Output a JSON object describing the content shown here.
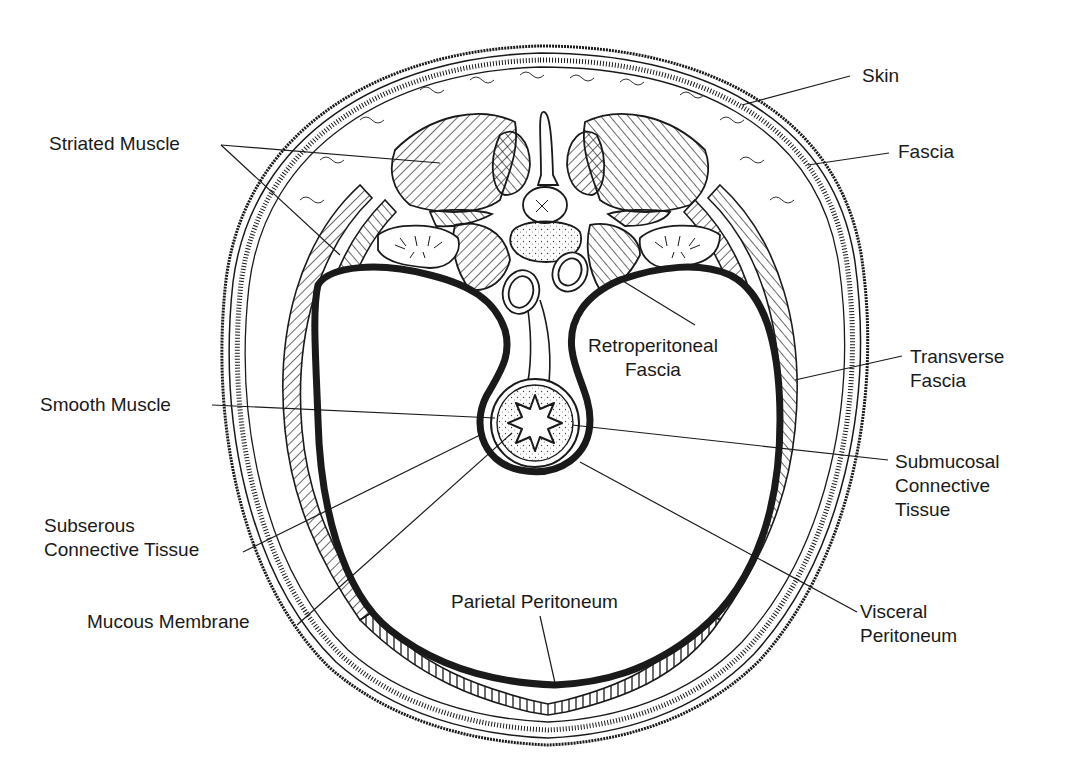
{
  "figure": {
    "colors": {
      "ink": "#1a1a1a",
      "background": "#ffffff",
      "fill_light": "#f7f7f7"
    }
  },
  "labels": [
    {
      "id": "skin",
      "lines": [
        "Skin"
      ],
      "x": 862,
      "y": 64,
      "align": "left",
      "leader": [
        [
          850,
          76
        ],
        [
          742,
          105
        ]
      ]
    },
    {
      "id": "fascia",
      "lines": [
        "Fascia"
      ],
      "x": 898,
      "y": 140,
      "align": "left",
      "leader": [
        [
          889,
          153
        ],
        [
          808,
          165
        ]
      ]
    },
    {
      "id": "striated-muscle",
      "lines": [
        "Striated Muscle"
      ],
      "x": 49,
      "y": 132,
      "align": "left",
      "leader": [
        [
          221,
          145
        ],
        [
          440,
          163
        ]
      ],
      "leader2": [
        [
          221,
          145
        ],
        [
          340,
          255
        ]
      ]
    },
    {
      "id": "retroperitoneal-fascia",
      "lines": [
        "Retroperitoneal",
        "Fascia"
      ],
      "x": 588,
      "y": 334,
      "align": "center",
      "leader": [
        [
          695,
          325
        ],
        [
          618,
          278
        ]
      ]
    },
    {
      "id": "transverse-fascia",
      "lines": [
        "Transverse",
        "Fascia"
      ],
      "x": 910,
      "y": 345,
      "align": "left",
      "leader": [
        [
          902,
          356
        ],
        [
          795,
          380
        ]
      ]
    },
    {
      "id": "smooth-muscle",
      "lines": [
        "Smooth Muscle"
      ],
      "x": 40,
      "y": 393,
      "align": "left",
      "leader": [
        [
          212,
          405
        ],
        [
          495,
          418
        ]
      ]
    },
    {
      "id": "submucosal-connective-tissue",
      "lines": [
        "Submucosal",
        "Connective",
        "Tissue"
      ],
      "x": 895,
      "y": 450,
      "align": "left",
      "leader": [
        [
          888,
          460
        ],
        [
          572,
          425
        ]
      ]
    },
    {
      "id": "subserous-connective-tissue",
      "lines": [
        "Subserous",
        "Connective Tissue"
      ],
      "x": 44,
      "y": 514,
      "align": "left",
      "leader": [
        [
          243,
          552
        ],
        [
          480,
          435
        ]
      ]
    },
    {
      "id": "mucous-membrane",
      "lines": [
        "Mucous Membrane"
      ],
      "x": 87,
      "y": 610,
      "align": "left",
      "leader": [
        [
          297,
          625
        ],
        [
          512,
          433
        ]
      ]
    },
    {
      "id": "parietal-peritoneum",
      "lines": [
        "Parietal Peritoneum"
      ],
      "x": 451,
      "y": 590,
      "align": "left",
      "leader": [
        [
          540,
          616
        ],
        [
          555,
          683
        ]
      ]
    },
    {
      "id": "visceral-peritoneum",
      "lines": [
        "Visceral",
        "Peritoneum"
      ],
      "x": 860,
      "y": 600,
      "align": "left",
      "leader": [
        [
          857,
          612
        ],
        [
          580,
          462
        ]
      ]
    }
  ]
}
